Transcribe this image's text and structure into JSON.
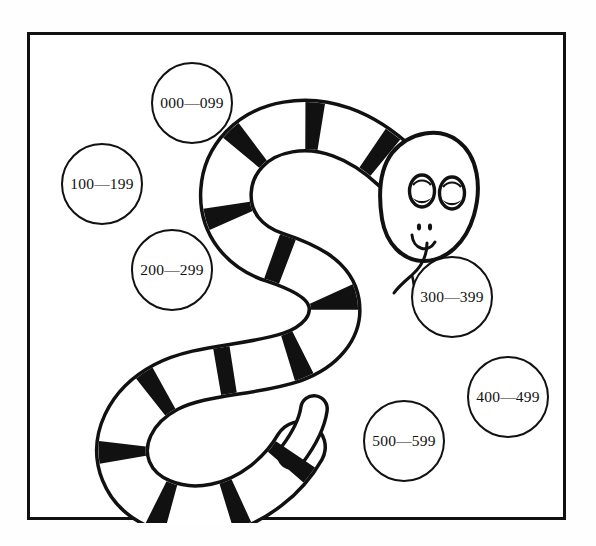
{
  "figure": {
    "caption_text": "",
    "background_color": "#fefefe",
    "frame_color": "#111111",
    "ink_color": "#111111",
    "paper_color": "#ffffff"
  },
  "illustration": {
    "subject_name": "cartoon banded snake",
    "description": "A coiled smiling snake with black bands, forked tongue, and heavy-lidded eyes"
  },
  "buckets": [
    {
      "label": "000—099",
      "cx": 162,
      "cy": 68,
      "r": 41
    },
    {
      "label": "100—199",
      "cx": 72,
      "cy": 149,
      "r": 41
    },
    {
      "label": "200—299",
      "cx": 142,
      "cy": 235,
      "r": 41
    },
    {
      "label": "300—399",
      "cx": 422,
      "cy": 262,
      "r": 41
    },
    {
      "label": "400—499",
      "cx": 478,
      "cy": 362,
      "r": 41
    },
    {
      "label": "500—599",
      "cx": 374,
      "cy": 406,
      "r": 41
    }
  ]
}
